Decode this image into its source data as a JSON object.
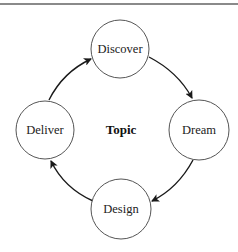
{
  "diagram": {
    "type": "cycle",
    "center": {
      "label": "Topic",
      "x": 121,
      "y": 130
    },
    "nodes": [
      {
        "id": "discover",
        "label": "Discover",
        "cx": 120,
        "cy": 49,
        "r": 29
      },
      {
        "id": "dream",
        "label": "Dream",
        "cx": 199,
        "cy": 130,
        "r": 30
      },
      {
        "id": "design",
        "label": "Design",
        "cx": 121,
        "cy": 209,
        "r": 30
      },
      {
        "id": "deliver",
        "label": "Deliver",
        "cx": 45,
        "cy": 130,
        "r": 29
      }
    ],
    "edges": [
      {
        "from": "discover",
        "to": "dream"
      },
      {
        "from": "dream",
        "to": "design"
      },
      {
        "from": "design",
        "to": "deliver"
      },
      {
        "from": "deliver",
        "to": "discover"
      }
    ],
    "colors": {
      "stroke": "#555555",
      "arrow": "#1a1a1a",
      "rule": "#8a8a8a"
    }
  }
}
